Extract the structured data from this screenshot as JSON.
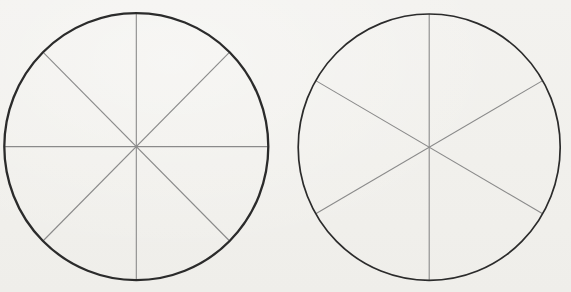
{
  "figure": {
    "background_color": "#f2f1ed",
    "width": 571,
    "height": 292,
    "circles": [
      {
        "name": "circle-divided-into-eighths",
        "sectors": 8,
        "cx": 136.3,
        "cy": 146.6,
        "rx": 132,
        "ry": 133.5,
        "diameter_angles_deg": [
          0,
          45,
          90,
          135
        ],
        "outline_color": "#2b2b2b",
        "outline_width": 2.3,
        "line_color": "#8a8a8a",
        "line_width": 1.1
      },
      {
        "name": "circle-divided-into-sixths",
        "sectors": 6,
        "cx": 429.2,
        "cy": 147.2,
        "rx": 131,
        "ry": 133.2,
        "diameter_angles_deg": [
          30,
          90,
          150
        ],
        "outline_color": "#2b2b2b",
        "outline_width": 1.7,
        "line_color": "#8a8a8a",
        "line_width": 1.1
      }
    ]
  }
}
